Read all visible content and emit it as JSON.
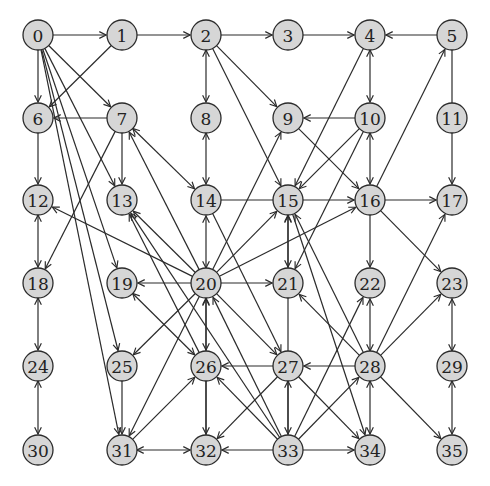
{
  "diagram": {
    "type": "directed-graph",
    "colors": {
      "node_fill": "#d6d6d6",
      "stroke": "#2b2b2b",
      "text": "#222222",
      "background": "#ffffff"
    },
    "node_radius": 15,
    "nodes": [
      {
        "id": "0",
        "x": 38,
        "y": 35
      },
      {
        "id": "1",
        "x": 122,
        "y": 35
      },
      {
        "id": "2",
        "x": 206,
        "y": 35
      },
      {
        "id": "3",
        "x": 288,
        "y": 35
      },
      {
        "id": "4",
        "x": 370,
        "y": 35
      },
      {
        "id": "5",
        "x": 452,
        "y": 35
      },
      {
        "id": "6",
        "x": 38,
        "y": 118
      },
      {
        "id": "7",
        "x": 122,
        "y": 118
      },
      {
        "id": "8",
        "x": 206,
        "y": 118
      },
      {
        "id": "9",
        "x": 288,
        "y": 118
      },
      {
        "id": "10",
        "x": 370,
        "y": 118
      },
      {
        "id": "11",
        "x": 452,
        "y": 118
      },
      {
        "id": "12",
        "x": 38,
        "y": 200
      },
      {
        "id": "13",
        "x": 122,
        "y": 200
      },
      {
        "id": "14",
        "x": 206,
        "y": 200
      },
      {
        "id": "15",
        "x": 288,
        "y": 200
      },
      {
        "id": "16",
        "x": 370,
        "y": 200
      },
      {
        "id": "17",
        "x": 452,
        "y": 200
      },
      {
        "id": "18",
        "x": 38,
        "y": 283
      },
      {
        "id": "19",
        "x": 122,
        "y": 283
      },
      {
        "id": "20",
        "x": 206,
        "y": 283
      },
      {
        "id": "21",
        "x": 288,
        "y": 283
      },
      {
        "id": "22",
        "x": 370,
        "y": 283
      },
      {
        "id": "23",
        "x": 452,
        "y": 283
      },
      {
        "id": "24",
        "x": 38,
        "y": 366
      },
      {
        "id": "25",
        "x": 122,
        "y": 366
      },
      {
        "id": "26",
        "x": 206,
        "y": 366
      },
      {
        "id": "27",
        "x": 288,
        "y": 366
      },
      {
        "id": "28",
        "x": 370,
        "y": 366
      },
      {
        "id": "29",
        "x": 452,
        "y": 366
      },
      {
        "id": "30",
        "x": 38,
        "y": 450
      },
      {
        "id": "31",
        "x": 122,
        "y": 450
      },
      {
        "id": "32",
        "x": 206,
        "y": 450
      },
      {
        "id": "33",
        "x": 288,
        "y": 450
      },
      {
        "id": "34",
        "x": 370,
        "y": 450
      },
      {
        "id": "35",
        "x": 452,
        "y": 450
      }
    ],
    "edges": [
      {
        "from": "0",
        "to": "1",
        "bi": false
      },
      {
        "from": "1",
        "to": "2",
        "bi": false
      },
      {
        "from": "2",
        "to": "3",
        "bi": false
      },
      {
        "from": "3",
        "to": "4",
        "bi": false
      },
      {
        "from": "5",
        "to": "4",
        "bi": false
      },
      {
        "from": "0",
        "to": "6",
        "bi": false
      },
      {
        "from": "1",
        "to": "6",
        "bi": false
      },
      {
        "from": "7",
        "to": "6",
        "bi": false
      },
      {
        "from": "0",
        "to": "7",
        "bi": false
      },
      {
        "from": "2",
        "to": "8",
        "bi": true
      },
      {
        "from": "2",
        "to": "9",
        "bi": false
      },
      {
        "from": "2",
        "to": "15",
        "bi": false
      },
      {
        "from": "10",
        "to": "9",
        "bi": false
      },
      {
        "from": "4",
        "to": "10",
        "bi": true
      },
      {
        "from": "4",
        "to": "15",
        "bi": false
      },
      {
        "from": "5",
        "to": "17",
        "bi": false
      },
      {
        "from": "16",
        "to": "5",
        "bi": false
      },
      {
        "from": "6",
        "to": "12",
        "bi": false
      },
      {
        "from": "7",
        "to": "13",
        "bi": false
      },
      {
        "from": "7",
        "to": "18",
        "bi": false
      },
      {
        "from": "7",
        "to": "14",
        "bi": true
      },
      {
        "from": "0",
        "to": "13",
        "bi": false
      },
      {
        "from": "0",
        "to": "19",
        "bi": false
      },
      {
        "from": "0",
        "to": "25",
        "bi": false
      },
      {
        "from": "0",
        "to": "31",
        "bi": false
      },
      {
        "from": "8",
        "to": "14",
        "bi": true
      },
      {
        "from": "9",
        "to": "16",
        "bi": false
      },
      {
        "from": "10",
        "to": "15",
        "bi": false
      },
      {
        "from": "10",
        "to": "21",
        "bi": false
      },
      {
        "from": "10",
        "to": "16",
        "bi": true
      },
      {
        "from": "12",
        "to": "18",
        "bi": true
      },
      {
        "from": "14",
        "to": "16",
        "bi": false
      },
      {
        "from": "16",
        "to": "17",
        "bi": false
      },
      {
        "from": "16",
        "to": "22",
        "bi": false
      },
      {
        "from": "16",
        "to": "23",
        "bi": false
      },
      {
        "from": "20",
        "to": "12",
        "bi": false
      },
      {
        "from": "20",
        "to": "13",
        "bi": false
      },
      {
        "from": "20",
        "to": "19",
        "bi": false
      },
      {
        "from": "20",
        "to": "21",
        "bi": false
      },
      {
        "from": "20",
        "to": "14",
        "bi": true
      },
      {
        "from": "20",
        "to": "15",
        "bi": false
      },
      {
        "from": "20",
        "to": "16",
        "bi": false
      },
      {
        "from": "20",
        "to": "9",
        "bi": false
      },
      {
        "from": "20",
        "to": "7",
        "bi": false
      },
      {
        "from": "20",
        "to": "25",
        "bi": false
      },
      {
        "from": "20",
        "to": "31",
        "bi": false
      },
      {
        "from": "20",
        "to": "26",
        "bi": true
      },
      {
        "from": "20",
        "to": "27",
        "bi": false
      },
      {
        "from": "14",
        "to": "27",
        "bi": false
      },
      {
        "from": "15",
        "to": "21",
        "bi": true
      },
      {
        "from": "15",
        "to": "34",
        "bi": false
      },
      {
        "from": "18",
        "to": "24",
        "bi": true
      },
      {
        "from": "24",
        "to": "30",
        "bi": true
      },
      {
        "from": "25",
        "to": "31",
        "bi": false
      },
      {
        "from": "31",
        "to": "32",
        "bi": true
      },
      {
        "from": "31",
        "to": "26",
        "bi": false
      },
      {
        "from": "26",
        "to": "32",
        "bi": false
      },
      {
        "from": "27",
        "to": "26",
        "bi": false
      },
      {
        "from": "28",
        "to": "27",
        "bi": false
      },
      {
        "from": "27",
        "to": "32",
        "bi": false
      },
      {
        "from": "27",
        "to": "33",
        "bi": true
      },
      {
        "from": "27",
        "to": "34",
        "bi": false
      },
      {
        "from": "28",
        "to": "22",
        "bi": true
      },
      {
        "from": "28",
        "to": "17",
        "bi": false
      },
      {
        "from": "28",
        "to": "23",
        "bi": false
      },
      {
        "from": "28",
        "to": "34",
        "bi": true
      },
      {
        "from": "28",
        "to": "35",
        "bi": false
      },
      {
        "from": "28",
        "to": "21",
        "bi": false
      },
      {
        "from": "28",
        "to": "15",
        "bi": false
      },
      {
        "from": "29",
        "to": "23",
        "bi": true
      },
      {
        "from": "29",
        "to": "35",
        "bi": true
      },
      {
        "from": "33",
        "to": "32",
        "bi": false
      },
      {
        "from": "33",
        "to": "34",
        "bi": false
      },
      {
        "from": "33",
        "to": "28",
        "bi": false
      },
      {
        "from": "33",
        "to": "22",
        "bi": false
      },
      {
        "from": "33",
        "to": "20",
        "bi": false
      },
      {
        "from": "33",
        "to": "26",
        "bi": false
      },
      {
        "from": "33",
        "to": "13",
        "bi": false
      },
      {
        "from": "33",
        "to": "15",
        "bi": false
      },
      {
        "from": "32",
        "to": "20",
        "bi": false
      },
      {
        "from": "19",
        "to": "26",
        "bi": true
      },
      {
        "from": "26",
        "to": "13",
        "bi": false
      }
    ]
  }
}
